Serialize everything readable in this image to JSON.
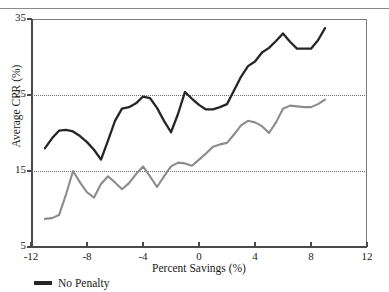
{
  "figure": {
    "top_caption": "",
    "legend": [
      {
        "label": "No Penalty",
        "color": "#262626"
      }
    ]
  },
  "chart_data": {
    "type": "line",
    "title": "",
    "xlabel": "Percent Savings (%)",
    "ylabel": "Average CPR (%)",
    "xlim": [
      -12,
      12
    ],
    "ylim": [
      5,
      35
    ],
    "xticks": [
      -12,
      -8,
      -4,
      0,
      4,
      8,
      12
    ],
    "xtick_labels": [
      "-12",
      "-8",
      "-4",
      "0",
      "4",
      "8",
      "12"
    ],
    "yticks": [
      5,
      15,
      25,
      35
    ],
    "ytick_labels": [
      "5",
      "15",
      "25",
      "35"
    ],
    "grid": "horizontal-dotted-at-15-and-25",
    "gridlines_y": [
      15,
      25
    ],
    "legend_position": "below-axes-left",
    "x": [
      -11,
      -10.5,
      -10,
      -9.5,
      -9,
      -8.5,
      -8,
      -7.5,
      -7,
      -6.5,
      -6,
      -5.5,
      -5,
      -4.5,
      -4,
      -3.5,
      -3,
      -2.5,
      -2,
      -1.5,
      -1,
      -0.5,
      0,
      0.5,
      1,
      1.5,
      2,
      2.5,
      3,
      3.5,
      4,
      4.5,
      5,
      5.5,
      6,
      6.5,
      7,
      7.5,
      8,
      8.5,
      9
    ],
    "series": [
      {
        "name": "No Penalty",
        "color": "#262626",
        "values": [
          18.0,
          19.3,
          20.3,
          20.4,
          20.2,
          19.6,
          18.8,
          17.8,
          16.5,
          19.0,
          21.6,
          23.2,
          23.4,
          23.9,
          24.8,
          24.6,
          23.3,
          21.6,
          20.1,
          22.5,
          25.4,
          24.5,
          23.7,
          23.1,
          23.1,
          23.4,
          23.8,
          25.6,
          27.4,
          28.8,
          29.4,
          30.6,
          31.2,
          32.1,
          33.1,
          32.0,
          31.1,
          31.1,
          31.1,
          32.2,
          33.8
        ]
      },
      {
        "name": "Penalty",
        "color": "#8c8c8c",
        "values": [
          8.7,
          8.8,
          9.2,
          11.9,
          15.0,
          13.5,
          12.2,
          11.5,
          13.3,
          14.3,
          13.5,
          12.6,
          13.4,
          14.6,
          15.6,
          14.3,
          12.9,
          14.3,
          15.6,
          16.1,
          16.0,
          15.7,
          16.5,
          17.3,
          18.2,
          18.5,
          18.7,
          19.8,
          21.0,
          21.6,
          21.4,
          20.9,
          20.0,
          21.4,
          23.2,
          23.6,
          23.5,
          23.4,
          23.4,
          23.8,
          24.4
        ]
      }
    ]
  }
}
